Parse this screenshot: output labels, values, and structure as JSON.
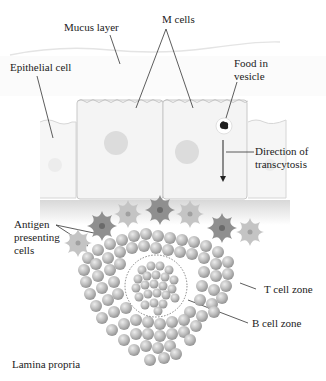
{
  "labels": {
    "mucus_layer": "Mucus layer",
    "m_cells": "M cells",
    "epithelial_cell": "Epithelial cell",
    "food_line1": "Food in",
    "food_line2": "vesicle",
    "direction_line1": "Direction of",
    "direction_line2": "transcytosis",
    "antigen_line1": "Antigen",
    "antigen_line2": "presenting",
    "antigen_line3": "cells",
    "t_cell_zone": "T cell zone",
    "b_cell_zone": "B cell zone",
    "lamina_propria": "Lamina propria"
  },
  "colors": {
    "cell_fill": "#f4f4f4",
    "cell_border": "#c8c8c8",
    "nucleus": "#dcdcdc",
    "apc_dark": "#8a8a8a",
    "apc_light": "#bdbdbd",
    "lymphocyte": "#b9b9b9",
    "text": "#222222"
  }
}
